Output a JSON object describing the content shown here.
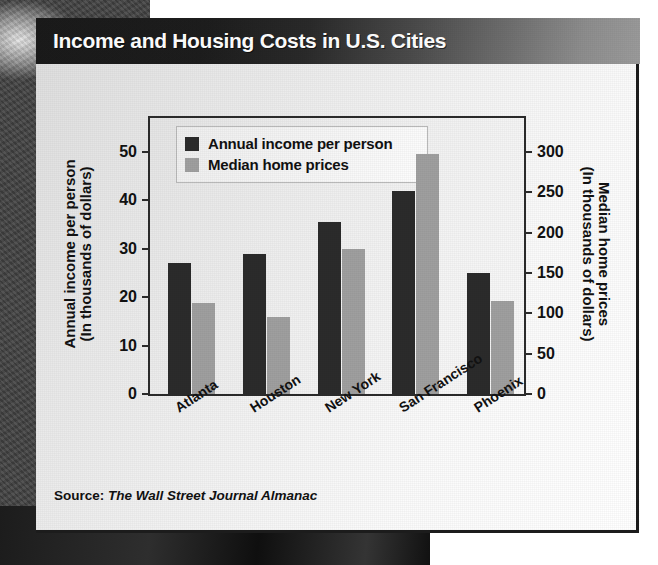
{
  "title": "Income and Housing Costs in U.S. Cities",
  "source": {
    "label": "Source:",
    "publication": "The Wall Street Journal Almanac"
  },
  "legend": [
    {
      "label": "Annual income per person",
      "color": "#2b2b2b",
      "swatch": "legend-swatch-income"
    },
    {
      "label": "Median home prices",
      "color": "#9f9f9f",
      "swatch": "legend-swatch-home"
    }
  ],
  "axes": {
    "left": {
      "title_line1": "Annual income per person",
      "title_line2": "(In thousands of dollars)",
      "ticks": [
        "50",
        "40",
        "30",
        "20",
        "10",
        "0"
      ],
      "min": 0,
      "max": 57
    },
    "right": {
      "title_line1": "Median home prices",
      "title_line2": "(In thousands of dollars)",
      "ticks": [
        "300",
        "250",
        "200",
        "150",
        "100",
        "50",
        "0"
      ],
      "min": 0,
      "max": 342
    }
  },
  "chart_data": {
    "type": "bar",
    "title": "Income and Housing Costs in U.S. Cities",
    "xlabel": "",
    "ylabel": "Annual income per person (In thousands of dollars)",
    "y2label": "Median home prices (In thousands of dollars)",
    "categories": [
      "Atlanta",
      "Houston",
      "New York",
      "San Francisco",
      "Phoenix"
    ],
    "series": [
      {
        "name": "Annual income per person",
        "axis": "left",
        "unit": "thousands of dollars",
        "color": "#2b2b2b",
        "values": [
          27,
          29,
          35.5,
          42,
          25
        ]
      },
      {
        "name": "Median home prices",
        "axis": "right",
        "unit": "thousands of dollars",
        "color": "#9f9f9f",
        "values": [
          113,
          96,
          180,
          298,
          115
        ]
      }
    ],
    "ylim": [
      0,
      57
    ],
    "y2lim": [
      0,
      342
    ],
    "grid": false,
    "legend_position": "upper-left-inside"
  }
}
